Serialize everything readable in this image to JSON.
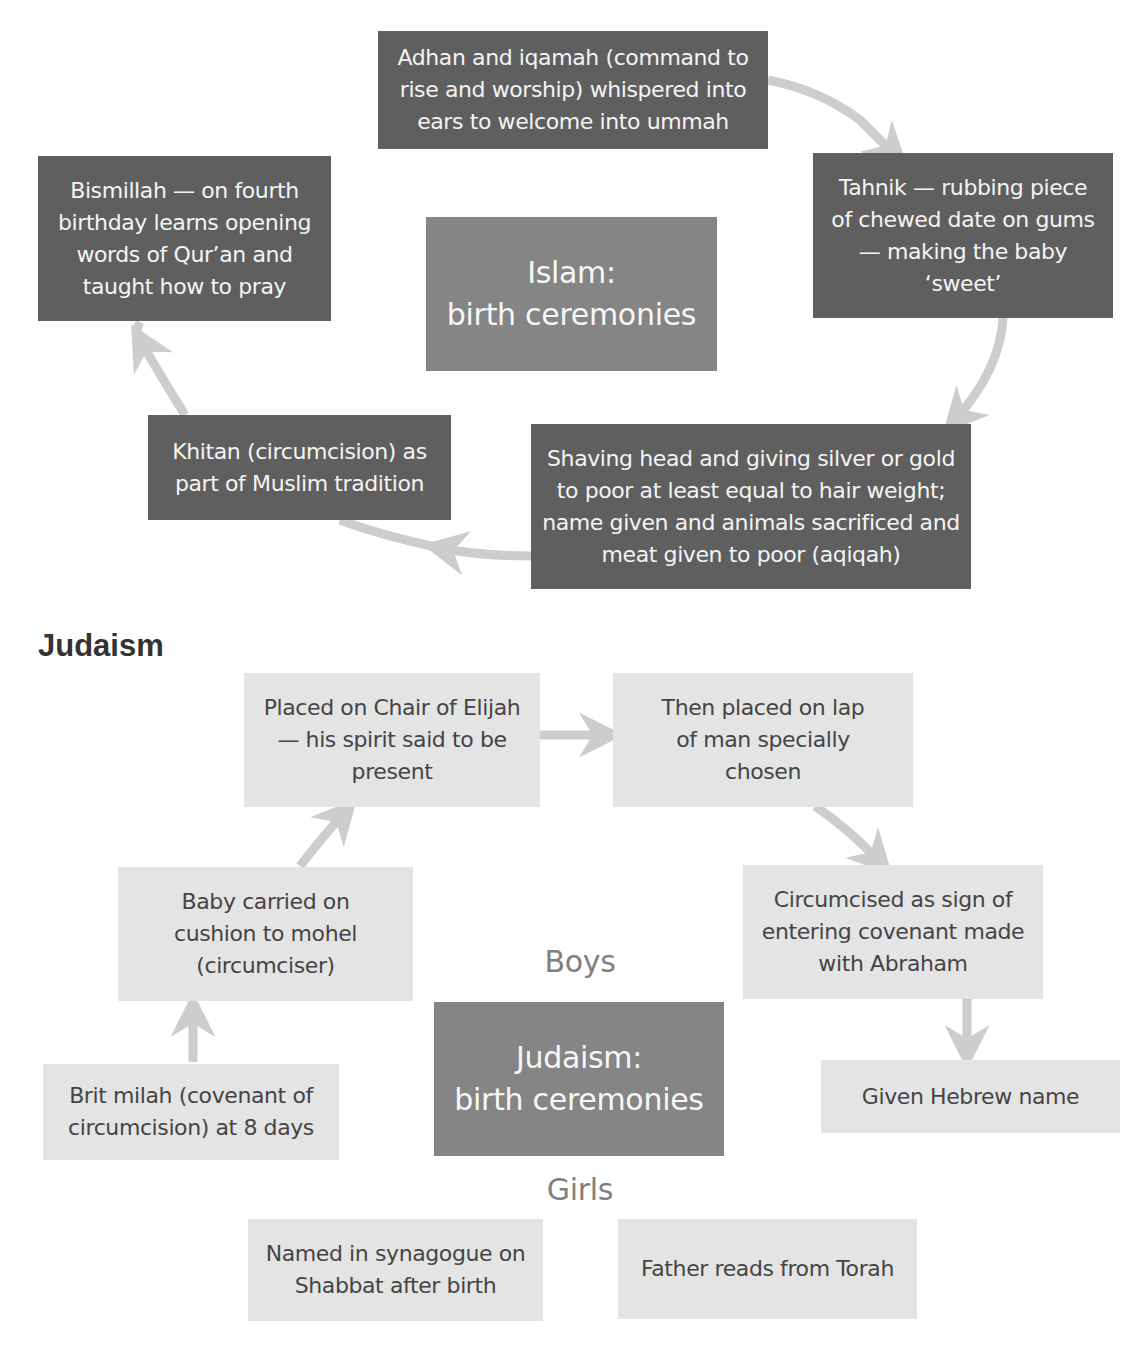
{
  "islam": {
    "center": {
      "line1": "Islam:",
      "line2": "birth ceremonies"
    },
    "steps": [
      {
        "id": "adhan",
        "text": "Adhan and iqamah (command to rise and worship) whispered into ears to welcome into ummah"
      },
      {
        "id": "tahnik",
        "text": "Tahnik — rubbing piece of chewed date on gums — making the baby ‘sweet’"
      },
      {
        "id": "shaving",
        "text": "Shaving head and giving silver or gold to poor at least equal to hair weight; name given and animals sacrificed and meat given to poor (aqiqah)"
      },
      {
        "id": "khitan",
        "text": "Khitan (circumcision) as part of Muslim tradition"
      },
      {
        "id": "bismillah",
        "text": "Bismillah — on fourth birthday learns opening words of Qur’an and taught how to pray"
      }
    ]
  },
  "judaism": {
    "heading": "Judaism",
    "center": {
      "line1": "Judaism:",
      "line2": "birth ceremonies"
    },
    "boys_label": "Boys",
    "girls_label": "Girls",
    "boys_steps": [
      {
        "id": "brit-milah",
        "text": "Brit milah (covenant of circumcision) at 8 days"
      },
      {
        "id": "cushion",
        "text": "Baby carried on cushion to mohel (circumciser)"
      },
      {
        "id": "chair-elijah",
        "text": "Placed on Chair of Elijah — his spirit said to be present"
      },
      {
        "id": "lap",
        "text": "Then placed on lap of man specially chosen"
      },
      {
        "id": "circumcised",
        "text": "Circumcised as sign of entering covenant made with Abraham"
      },
      {
        "id": "hebrew-name",
        "text": "Given Hebrew name"
      }
    ],
    "girls_steps": [
      {
        "id": "synagogue",
        "text": "Named in synagogue on Shabbat after birth"
      },
      {
        "id": "torah",
        "text": "Father reads from Torah"
      }
    ]
  },
  "colors": {
    "dark_box": "#5f5f5f",
    "center_box": "#858585",
    "light_box": "#e4e4e4",
    "arrow": "#cdcdcd",
    "label_gray": "#808080"
  }
}
